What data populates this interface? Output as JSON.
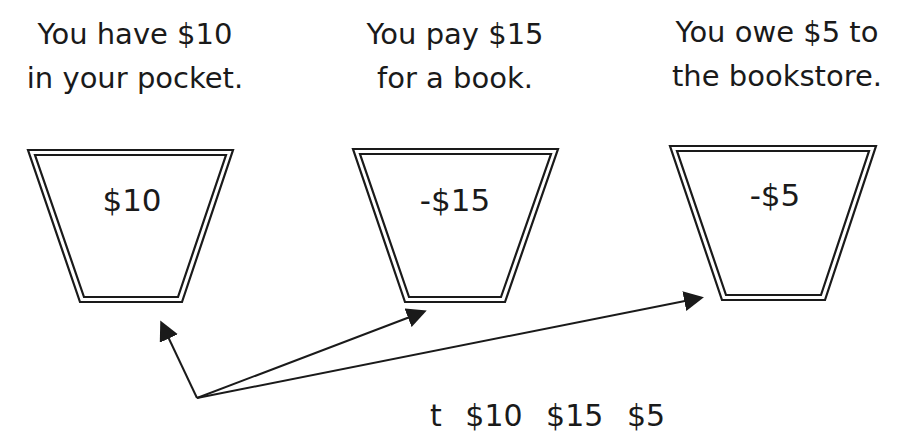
{
  "captions": [
    {
      "line1": "You have $10",
      "line2": "in your pocket."
    },
    {
      "line1": "You pay $15",
      "line2": "for a book."
    },
    {
      "line1": "You owe $5 to",
      "line2": "the bookstore."
    }
  ],
  "buckets": [
    {
      "value": "$10"
    },
    {
      "value": "-$15"
    },
    {
      "value": "-$5"
    }
  ],
  "arrows": {
    "origin": [
      197,
      398
    ],
    "targets": [
      [
        160,
        320
      ],
      [
        427,
        310
      ],
      [
        704,
        297
      ]
    ]
  },
  "bottom_equation_clipped": "t    $10    $15    $5",
  "colors": {
    "ink": "#1a1a1a",
    "background": "#ffffff"
  }
}
